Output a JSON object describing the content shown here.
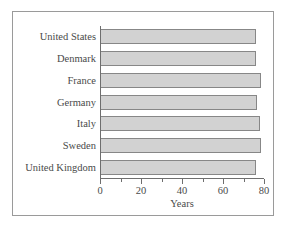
{
  "chart_data": {
    "type": "bar",
    "orientation": "horizontal",
    "title": "",
    "subtitle": "",
    "categories": [
      "United States",
      "Denmark",
      "France",
      "Germany",
      "Italy",
      "Sweden",
      "United Kingdom"
    ],
    "values": [
      76.3,
      76.3,
      78.4,
      76.5,
      78.1,
      78.6,
      76.2
    ],
    "xlabel": "Years",
    "ylabel": "",
    "xlim": [
      0,
      80
    ],
    "xticks": [
      0,
      20,
      40,
      60,
      80
    ],
    "xtick_labels": [
      "0",
      "20",
      "40",
      "60",
      "80"
    ],
    "minor_xticks": [
      10,
      30,
      50,
      70
    ],
    "grid": false,
    "legend": null,
    "series": [
      {
        "name": "Life expectancy",
        "values": [
          76.3,
          76.3,
          78.4,
          76.5,
          78.1,
          78.6,
          76.2
        ]
      }
    ],
    "colors": {
      "bar_fill": "#d2d2d2",
      "bar_edge": "#878787",
      "axis": "#6e6e6e",
      "text": "#4a4a4a",
      "frame": "#9a9a9a",
      "background": "#ffffff"
    }
  }
}
